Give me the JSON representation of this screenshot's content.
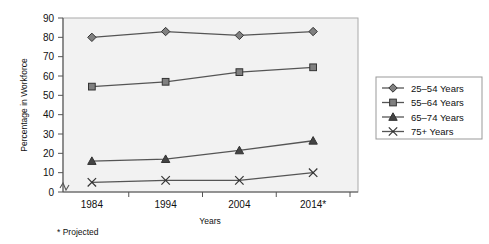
{
  "chart_data": {
    "type": "line",
    "title": "",
    "xlabel": "Years",
    "ylabel": "Percentage in Workforce",
    "categories": [
      "1984",
      "1994",
      "2004",
      "2014*"
    ],
    "x": [
      1984,
      1994,
      2004,
      2014
    ],
    "ylim": [
      0,
      90
    ],
    "ytick_step": 10,
    "yticks": [
      "0",
      "10",
      "20",
      "30",
      "40",
      "50",
      "60",
      "70",
      "80",
      "90"
    ],
    "grid": false,
    "axis_break": true,
    "legend_position": "right",
    "series": [
      {
        "name": "25–54 Years",
        "marker": "diamond",
        "values": [
          80,
          83,
          81,
          83
        ]
      },
      {
        "name": "55–64 Years",
        "marker": "square",
        "values": [
          54.5,
          57,
          62,
          64.5
        ]
      },
      {
        "name": "65–74 Years",
        "marker": "triangle",
        "values": [
          16,
          17,
          21.5,
          26.5
        ]
      },
      {
        "name": "75+ Years",
        "marker": "x",
        "values": [
          5,
          6,
          6,
          10
        ]
      }
    ],
    "footnote": "* Projected",
    "colors": {
      "plot_background": "#f2f2f2",
      "line": "#555555",
      "marker_fill": "#808080",
      "marker_stroke": "#333333",
      "axis": "#555555",
      "text": "#111111",
      "legend_border": "#999999",
      "page_background": "#ffffff"
    }
  },
  "axes": {
    "y_title": "Percentage in Workforce",
    "x_title": "Years"
  },
  "legend": {
    "items": [
      {
        "label": "25–54 Years",
        "marker": "diamond-marker"
      },
      {
        "label": "55–64 Years",
        "marker": "square-marker"
      },
      {
        "label": "65–74 Years",
        "marker": "triangle-marker"
      },
      {
        "label": "75+ Years",
        "marker": "x-marker"
      }
    ]
  },
  "footnote": {
    "text": "* Projected"
  }
}
